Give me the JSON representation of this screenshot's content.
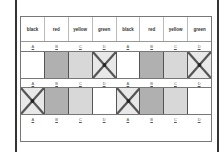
{
  "header": {
    "cells": [
      "black",
      "red",
      "yellow",
      "green",
      "black",
      "red",
      "yellow",
      "green"
    ]
  },
  "labels": [
    "A",
    "B",
    "C",
    "D",
    "A",
    "B",
    "C",
    "D"
  ],
  "rows": [
    {
      "boxes": [
        {
          "state": "white"
        },
        {
          "state": "dark"
        },
        {
          "state": "light"
        },
        {
          "state": "crossed"
        },
        {
          "state": "white"
        },
        {
          "state": "dark"
        },
        {
          "state": "light"
        },
        {
          "state": "crossed"
        }
      ]
    },
    {
      "boxes": [
        {
          "state": "crossed"
        },
        {
          "state": "dark"
        },
        {
          "state": "light"
        },
        {
          "state": "white"
        },
        {
          "state": "crossed"
        },
        {
          "state": "dark"
        },
        {
          "state": "light"
        },
        {
          "state": "white"
        }
      ]
    }
  ],
  "colors": {
    "white": "#ffffff",
    "dark": "#b0b0b0",
    "light": "#d8d8d8",
    "crossed": "#e8e8e8",
    "cross_stroke": "#555555"
  }
}
